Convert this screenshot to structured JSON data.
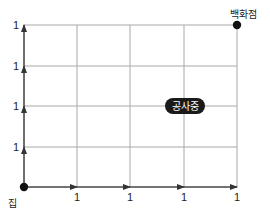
{
  "diagram": {
    "grid": {
      "cols": 4,
      "rows": 4,
      "x_lines": [
        24,
        77,
        130,
        184,
        237
      ],
      "y_lines": [
        25,
        66,
        106,
        147,
        187
      ],
      "line_color": "#a8a8a8",
      "arrow_color": "#333333"
    },
    "start": {
      "label": "집",
      "x": 24,
      "y": 187
    },
    "end": {
      "label": "백화점",
      "x": 237,
      "y": 25
    },
    "construction": {
      "label": "공사중",
      "x": 185,
      "y": 106
    },
    "x_segment_labels": [
      "1",
      "1",
      "1",
      "1"
    ],
    "y_segment_labels": [
      "1",
      "1",
      "1",
      "1"
    ]
  }
}
